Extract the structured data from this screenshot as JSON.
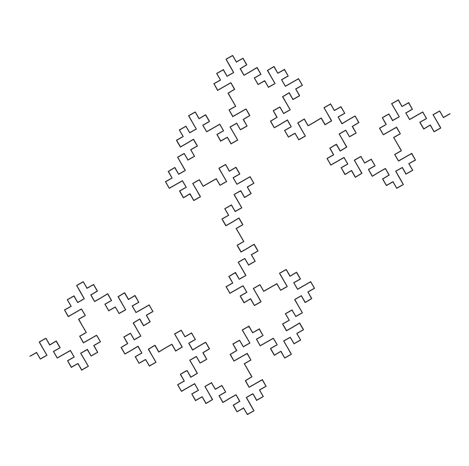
{
  "figure": {
    "kind": "fractal-curve",
    "symmetry": "6-fold star silhouette",
    "open_endpoints": 2
  },
  "canvas": {
    "width": 469,
    "height": 466,
    "background_color": "#ffffff"
  },
  "style": {
    "stroke_color": "#333333",
    "stroke_width": 1.15,
    "fill": "none",
    "linejoin": "round",
    "linecap": "round"
  },
  "lsystem": {
    "axiom": "F",
    "rules": {
      "F": "F+F-F-FF+F+F-F"
    },
    "angle_degrees": 90,
    "iterations": 3,
    "initial_heading_degrees": -30,
    "segment_length": 1
  },
  "bounds": {
    "x_min": 30,
    "x_max": 450,
    "y_min": 25,
    "y_max": 445,
    "padding": 14
  }
}
